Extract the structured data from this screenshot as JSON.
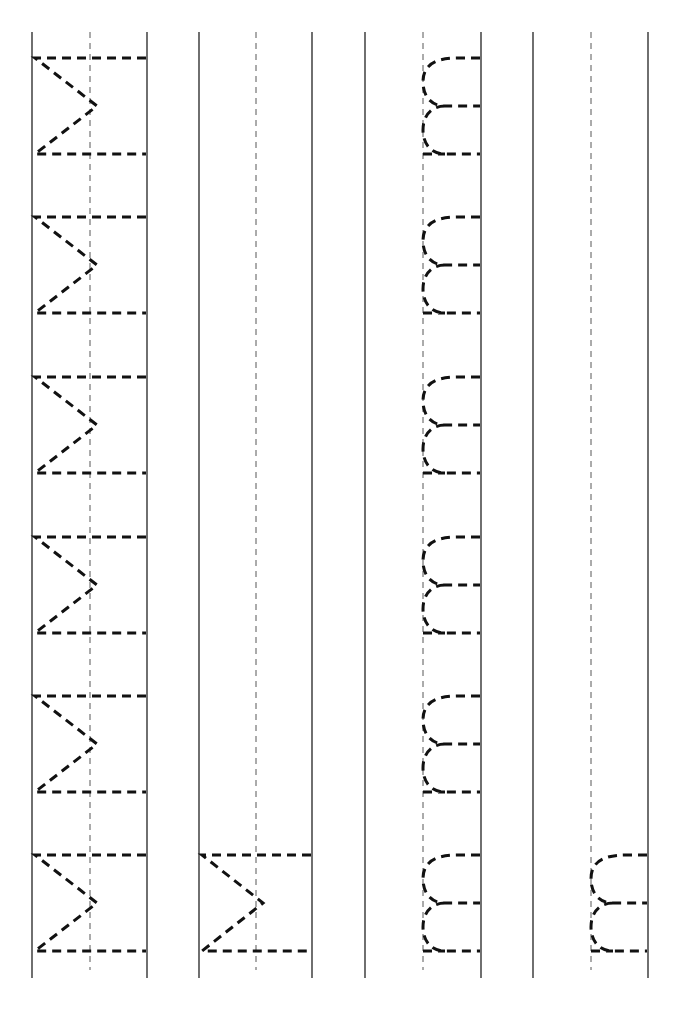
{
  "worksheet": {
    "type": "handwriting-tracing",
    "columns": [
      {
        "left_x": 32,
        "mid_x": 90,
        "right_x": 147,
        "letter": "M",
        "glyph_type": "uppercase-rotated",
        "rows": [
          0,
          1,
          2,
          3,
          4,
          5
        ]
      },
      {
        "left_x": 199,
        "mid_x": 256,
        "right_x": 312,
        "letter": "M",
        "glyph_type": "uppercase-rotated",
        "rows": [
          5
        ]
      },
      {
        "left_x": 365,
        "mid_x": 423,
        "right_x": 481,
        "letter": "m",
        "glyph_type": "lowercase-rotated",
        "rows": [
          0,
          1,
          2,
          3,
          4,
          5
        ]
      },
      {
        "left_x": 533,
        "mid_x": 591,
        "right_x": 648,
        "letter": "m",
        "glyph_type": "lowercase-rotated",
        "rows": [
          5
        ]
      }
    ],
    "row_tops": [
      58,
      217,
      377,
      537,
      696,
      855
    ],
    "row_height": 96,
    "line_top": 32,
    "line_bottom": 978,
    "colors": {
      "line": "#222222",
      "trace": "#111111",
      "background": "#ffffff"
    }
  }
}
